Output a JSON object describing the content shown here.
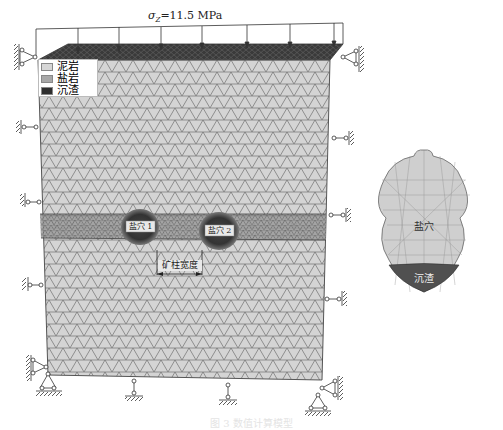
{
  "load": {
    "label": "σz=11.5 MPa",
    "symbol": "σ",
    "subscript": "Z",
    "value": "=11.5 MPa"
  },
  "legend": {
    "items": [
      {
        "label": "泥岩",
        "color": "#d6d6d6"
      },
      {
        "label": "盐岩",
        "color": "#a8a8a8"
      },
      {
        "label": "沉渣",
        "color": "#2e2e2e"
      }
    ]
  },
  "cavities": [
    {
      "label": "盐穴 1"
    },
    {
      "label": "盐穴 2"
    }
  ],
  "dimension": {
    "label": "矿柱宽度"
  },
  "detail_view": {
    "cavity_label": "盐穴",
    "sediment_label": "沉渣"
  },
  "caption": "图 3  数值计算模型",
  "colors": {
    "mudstone": "#d6d6d6",
    "salt": "#a8a8a8",
    "sediment": "#2e2e2e",
    "mesh_line": "#6e6e6e"
  }
}
